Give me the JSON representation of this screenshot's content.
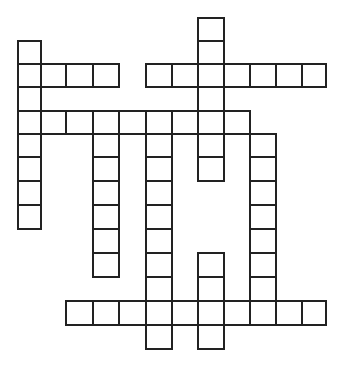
{
  "puzzle": {
    "type": "crossword",
    "border_color": "#222222",
    "background_color": "#ffffff",
    "col_edges": [
      18,
      41,
      66,
      93,
      119,
      146,
      172,
      198,
      224,
      250,
      276,
      302,
      326
    ],
    "row_edges": [
      18,
      41,
      64,
      87,
      111,
      134,
      157,
      181,
      205,
      229,
      253,
      277,
      301,
      325,
      349
    ],
    "rows": [
      {
        "row": 0,
        "cols": [
          7
        ]
      },
      {
        "row": 1,
        "cols": [
          0,
          7
        ]
      },
      {
        "row": 2,
        "cols": [
          0,
          1,
          2,
          3,
          5,
          6,
          7,
          8,
          9,
          10,
          11
        ]
      },
      {
        "row": 3,
        "cols": [
          0,
          7
        ]
      },
      {
        "row": 4,
        "cols": [
          0,
          1,
          2,
          3,
          4,
          5,
          6,
          7,
          8
        ]
      },
      {
        "row": 5,
        "cols": [
          0,
          3,
          5,
          7,
          9
        ]
      },
      {
        "row": 6,
        "cols": [
          0,
          3,
          5,
          7,
          9
        ]
      },
      {
        "row": 7,
        "cols": [
          0,
          3,
          5,
          9
        ]
      },
      {
        "row": 8,
        "cols": [
          0,
          3,
          5,
          9
        ]
      },
      {
        "row": 9,
        "cols": [
          3,
          5,
          9
        ]
      },
      {
        "row": 10,
        "cols": [
          3,
          5,
          7,
          9
        ]
      },
      {
        "row": 11,
        "cols": [
          5,
          7,
          9
        ]
      },
      {
        "row": 12,
        "cols": [
          2,
          3,
          4,
          5,
          6,
          7,
          8,
          9,
          10,
          11
        ]
      },
      {
        "row": 13,
        "cols": [
          5,
          7
        ]
      }
    ]
  }
}
